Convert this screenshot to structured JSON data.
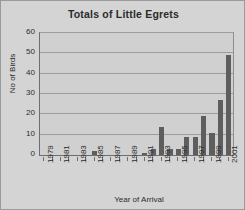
{
  "chart_data": {
    "type": "bar",
    "title": "Totals of Little Egrets",
    "xlabel": "Year of Arrival",
    "ylabel": "No of Birds",
    "ylim": [
      0,
      60
    ],
    "ytick_labels": [
      "0",
      "10",
      "20",
      "30",
      "40",
      "50",
      "60"
    ],
    "yticks": [
      0,
      10,
      20,
      30,
      40,
      50,
      60
    ],
    "grid": true,
    "legend": false,
    "xtick_labels": [
      "1979",
      "1981",
      "1983",
      "1985",
      "1987",
      "1989",
      "1991",
      "1993",
      "1995",
      "1997",
      "1999",
      "2001"
    ],
    "categories": [
      "1979",
      "1980",
      "1981",
      "1982",
      "1983",
      "1984",
      "1985",
      "1986",
      "1987",
      "1988",
      "1989",
      "1990",
      "1991",
      "1992",
      "1993",
      "1994",
      "1995",
      "1996",
      "1997",
      "1998",
      "1999",
      "2000",
      "2001"
    ],
    "values": [
      0,
      0,
      0,
      0,
      0,
      0,
      2,
      0,
      0,
      0,
      0,
      0,
      1,
      3,
      14,
      3,
      3,
      9,
      9,
      19,
      11,
      27,
      49
    ],
    "bar_color": "#5e5e5e",
    "plot_background": "#d0d0d0",
    "figure_background": "#d4d4d4",
    "axis_color": "#6e6e6e",
    "gridline_color": "#9d9d9d",
    "text_color": "#2b2b2b"
  }
}
